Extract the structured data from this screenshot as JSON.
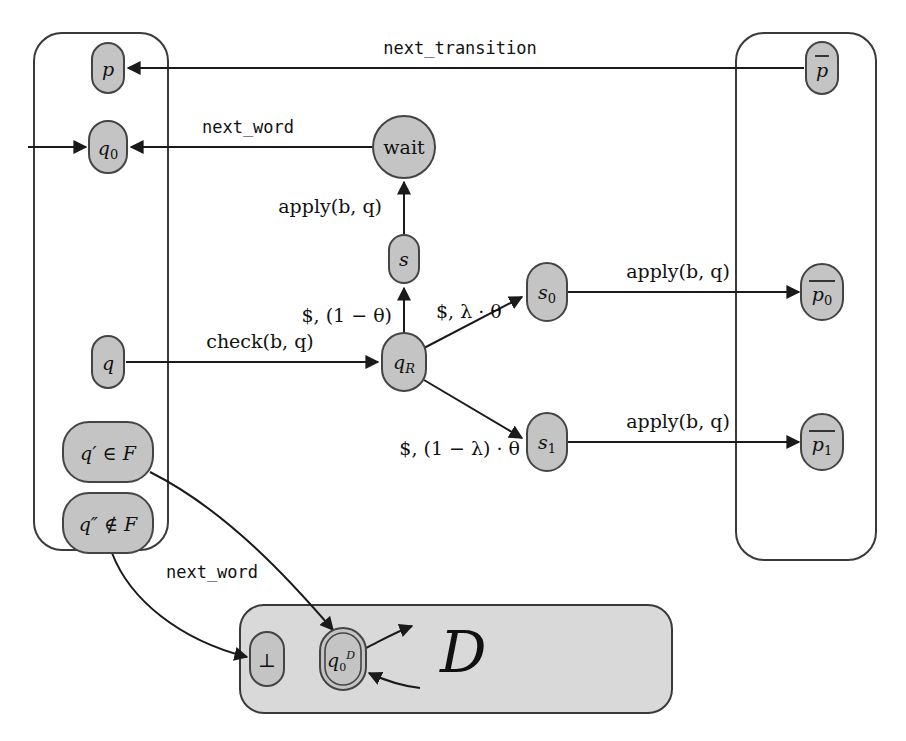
{
  "figure": {
    "type": "state-transition-diagram",
    "background": "#ffffff",
    "node_fill": "#c4c4c4",
    "node_stroke": "#444444",
    "container_stroke": "#3a3a3a",
    "container_fill_gray": "#d9d9d9",
    "edge_color": "#1a1a1a"
  },
  "containers": [
    {
      "id": "left-group",
      "label": "",
      "x": 34,
      "y": 33,
      "w": 134,
      "h": 517,
      "fill": "none"
    },
    {
      "id": "right-group",
      "label": "",
      "x": 736,
      "y": 33,
      "w": 140,
      "h": 527,
      "fill": "none"
    },
    {
      "id": "bottom-group",
      "label": "",
      "x": 240,
      "y": 605,
      "w": 432,
      "h": 108,
      "fill": "#d9d9d9"
    }
  ],
  "nodes": [
    {
      "id": "p",
      "label": "p",
      "shape": "rounded-rect",
      "cx": 108,
      "cy": 68,
      "rx": 16,
      "ry": 25,
      "italic": true,
      "overbar": false
    },
    {
      "id": "q0",
      "label": "q",
      "sub": "0",
      "shape": "rounded-rect",
      "cx": 108,
      "cy": 147,
      "rx": 19,
      "ry": 26,
      "italic": true,
      "overbar": false
    },
    {
      "id": "q",
      "label": "q",
      "shape": "rounded-rect",
      "cx": 108,
      "cy": 362,
      "rx": 16,
      "ry": 26,
      "italic": true,
      "overbar": false
    },
    {
      "id": "qprimeF",
      "label": "q′ ∈ F",
      "shape": "rounded-rect",
      "cx": 108,
      "cy": 452,
      "rx": 45,
      "ry": 30,
      "italic": true,
      "overbar": false
    },
    {
      "id": "qppnotF",
      "label": "q″ ∉ F",
      "shape": "rounded-rect",
      "cx": 108,
      "cy": 523,
      "rx": 45,
      "ry": 30,
      "italic": true,
      "overbar": false
    },
    {
      "id": "wait",
      "label": "wait",
      "shape": "circle",
      "cx": 404,
      "cy": 147,
      "rx": 31,
      "ry": 31,
      "italic": false,
      "overbar": false
    },
    {
      "id": "s",
      "label": "s",
      "shape": "rounded-rect",
      "cx": 404,
      "cy": 259,
      "rx": 15,
      "ry": 24,
      "italic": true,
      "overbar": false
    },
    {
      "id": "qR",
      "label": "q",
      "sub": "R",
      "shape": "rounded-rect",
      "cx": 404,
      "cy": 362,
      "rx": 22,
      "ry": 29,
      "italic": true,
      "overbar": false
    },
    {
      "id": "s0",
      "label": "s",
      "sub": "0",
      "shape": "rounded-rect",
      "cx": 547,
      "cy": 292,
      "rx": 20,
      "ry": 29,
      "italic": true,
      "overbar": false
    },
    {
      "id": "s1",
      "label": "s",
      "sub": "1",
      "shape": "rounded-rect",
      "cx": 547,
      "cy": 442,
      "rx": 20,
      "ry": 29,
      "italic": true,
      "overbar": false
    },
    {
      "id": "pbar",
      "label": "p",
      "shape": "rounded-rect",
      "cx": 822,
      "cy": 68,
      "rx": 16,
      "ry": 26,
      "italic": true,
      "overbar": true
    },
    {
      "id": "pbar0",
      "label": "p",
      "sub": "0",
      "shape": "rounded-rect",
      "cx": 822,
      "cy": 292,
      "rx": 21,
      "ry": 28,
      "italic": true,
      "overbar": true
    },
    {
      "id": "pbar1",
      "label": "p",
      "sub": "1",
      "shape": "rounded-rect",
      "cx": 822,
      "cy": 442,
      "rx": 21,
      "ry": 28,
      "italic": true,
      "overbar": true
    },
    {
      "id": "bot",
      "label": "⊥",
      "shape": "rounded-rect",
      "cx": 267,
      "cy": 659,
      "rx": 17,
      "ry": 27,
      "italic": false,
      "overbar": false
    },
    {
      "id": "q0D",
      "label": "q",
      "sub": "0",
      "sup": "D",
      "shape": "double-rounded-rect",
      "cx": 343,
      "cy": 659,
      "rx": 21,
      "ry": 29,
      "italic": true,
      "overbar": false
    }
  ],
  "edges": [
    {
      "id": "e-init-q0",
      "from": "start",
      "to": "q0",
      "label": ""
    },
    {
      "id": "e-pbar-p",
      "from": "pbar",
      "to": "p",
      "label": "next_transition",
      "label_style": "mono"
    },
    {
      "id": "e-wait-q0",
      "from": "wait",
      "to": "q0",
      "label": "next_word",
      "label_style": "mono"
    },
    {
      "id": "e-s-wait",
      "from": "s",
      "to": "wait",
      "label": "apply(b, q)",
      "label_style": "serif"
    },
    {
      "id": "e-qR-s",
      "from": "qR",
      "to": "s",
      "label": "$, (1 − θ)",
      "label_style": "serif"
    },
    {
      "id": "e-q-qR",
      "from": "q",
      "to": "qR",
      "label": "check(b, q)",
      "label_style": "serif"
    },
    {
      "id": "e-qR-s0",
      "from": "qR",
      "to": "s0",
      "label": "$, λ · θ",
      "label_style": "serif"
    },
    {
      "id": "e-qR-s1",
      "from": "qR",
      "to": "s1",
      "label": "$, (1 − λ) · θ",
      "label_style": "serif"
    },
    {
      "id": "e-s0-pbar0",
      "from": "s0",
      "to": "pbar0",
      "label": "apply(b, q)",
      "label_style": "serif"
    },
    {
      "id": "e-s1-pbar1",
      "from": "s1",
      "to": "pbar1",
      "label": "apply(b, q)",
      "label_style": "serif"
    },
    {
      "id": "e-qpp-bot",
      "from": "qppnotF",
      "to": "bot",
      "label": "next_word",
      "label_style": "mono"
    },
    {
      "id": "e-qprime-q0D",
      "from": "qprimeF",
      "to": "q0D",
      "label": ""
    },
    {
      "id": "e-q0D-out",
      "from": "q0D",
      "to": "D",
      "label": ""
    },
    {
      "id": "e-in-q0D",
      "from": "D",
      "to": "q0D",
      "label": ""
    }
  ],
  "labels": {
    "next_transition": "next_transition",
    "next_word_top": "next_word",
    "next_word_bottom": "next_word",
    "apply_wait": "apply(b, q)",
    "apply_s0": "apply(b, q)",
    "apply_s1": "apply(b, q)",
    "check": "check(b, q)",
    "prob_stay": "$, (1 − θ)",
    "prob_lambda": "$, λ · θ",
    "prob_one_minus_lambda": "$, (1 − λ) · θ",
    "calligraphic_D": "D"
  },
  "node_texts": {
    "p": "p",
    "q0": "q0",
    "q": "q",
    "q_prime_in_F": "q′ ∈ F",
    "q_dprime_notin_F": "q″ ∉ F",
    "wait": "wait",
    "s": "s",
    "qR": "qR",
    "s0": "s0",
    "s1": "s1",
    "p_bar": "p̄",
    "p_bar_0": "p̄0",
    "p_bar_1": "p̄1",
    "bottom": "⊥",
    "q0_D": "q0^D"
  }
}
